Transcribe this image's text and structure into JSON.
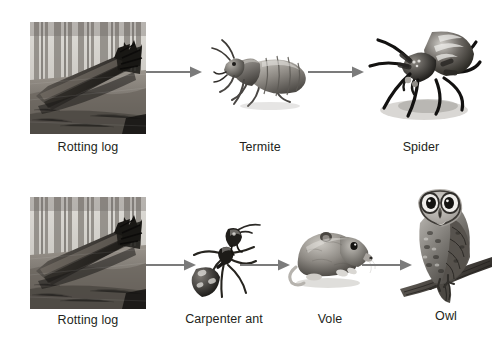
{
  "diagram": {
    "background_color": "#ffffff",
    "label_color": "#231f20",
    "arrow_color": "#7b7b7b",
    "rows": [
      {
        "id": "chain-1",
        "nodes": [
          {
            "label": "Rotting log",
            "icon": "rotting-log-photo"
          },
          {
            "label": "Termite",
            "icon": "termite-illustration"
          },
          {
            "label": "Spider",
            "icon": "spider-illustration"
          }
        ],
        "arrows": [
          {
            "name": "arrow-log-to-termite"
          },
          {
            "name": "arrow-termite-to-spider"
          }
        ]
      },
      {
        "id": "chain-2",
        "nodes": [
          {
            "label": "Rotting log",
            "icon": "rotting-log-photo"
          },
          {
            "label": "Carpenter ant",
            "icon": "carpenter-ant-illustration"
          },
          {
            "label": "Vole",
            "icon": "vole-illustration"
          },
          {
            "label": "Owl",
            "icon": "owl-illustration"
          }
        ],
        "arrows": [
          {
            "name": "arrow-log-to-ant"
          },
          {
            "name": "arrow-ant-to-vole"
          },
          {
            "name": "arrow-vole-to-owl"
          }
        ]
      }
    ]
  }
}
